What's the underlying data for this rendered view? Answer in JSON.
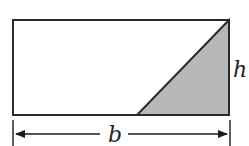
{
  "diagram": {
    "labels": {
      "height": "h",
      "base": "b"
    },
    "colors": {
      "stroke": "#2a2a2a",
      "shade": "#b8b8b8",
      "background": "#ffffff"
    }
  }
}
